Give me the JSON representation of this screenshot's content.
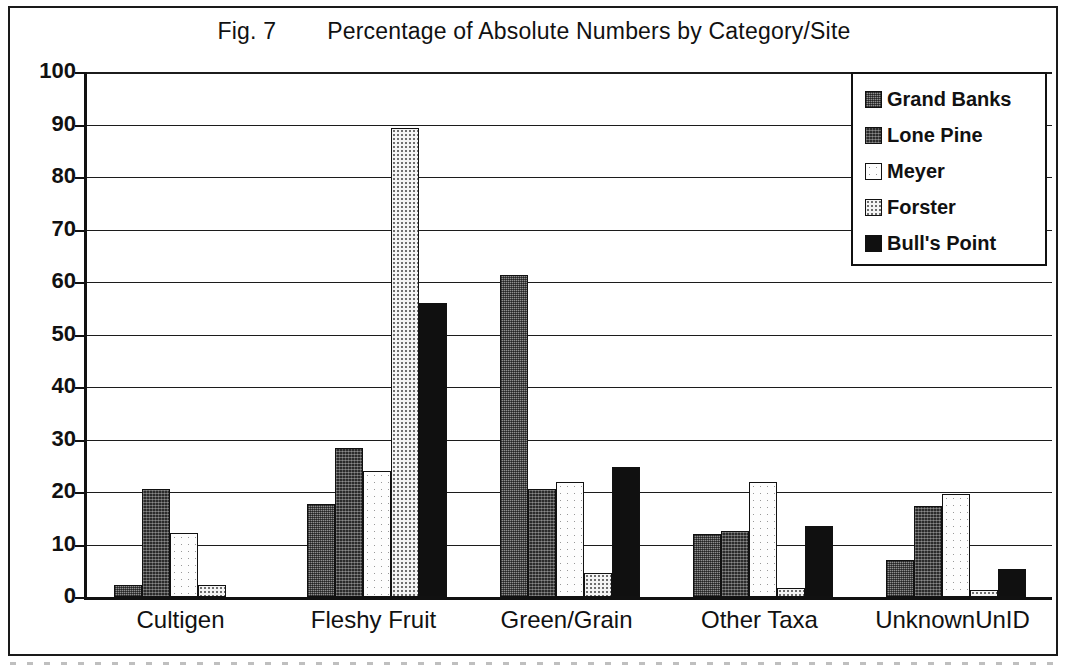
{
  "figure": {
    "label": "Fig. 7",
    "title": "Percentage of Absolute Numbers by Category/Site"
  },
  "chart_data": {
    "type": "bar",
    "title": "Fig. 7    Percentage of Absolute Numbers by Category/Site",
    "xlabel": "",
    "ylabel": "",
    "ylim": [
      0,
      100
    ],
    "yticks": [
      0,
      10,
      20,
      30,
      40,
      50,
      60,
      70,
      80,
      90,
      100
    ],
    "ytick_labels": [
      "0",
      "10",
      "20",
      "30",
      "40",
      "50",
      "60",
      "70",
      "80",
      "90",
      "100"
    ],
    "grid": true,
    "legend_position": "top-right",
    "categories": [
      "Cultigen",
      "Fleshy Fruit",
      "Green/Grain",
      "Other Taxa",
      "UnknownUnID"
    ],
    "series": [
      {
        "name": "Grand Banks",
        "swatch": "medium-gray-dither",
        "color": "#8f8f8f",
        "values": [
          2.2,
          17.8,
          61.3,
          12.0,
          7.0
        ]
      },
      {
        "name": "Lone Pine",
        "swatch": "dark-dither",
        "color": "#2b2b2b",
        "values": [
          20.6,
          28.3,
          20.5,
          12.6,
          17.4
        ]
      },
      {
        "name": "Meyer",
        "swatch": "white-sparse-dots",
        "color": "#fdfdfd",
        "values": [
          12.2,
          24.0,
          22.0,
          22.0,
          19.7
        ]
      },
      {
        "name": "Forster",
        "swatch": "light-dotted",
        "color": "#f4f4f4",
        "values": [
          2.2,
          89.3,
          4.5,
          1.7,
          1.3
        ]
      },
      {
        "name": "Bull's Point",
        "swatch": "solid-black",
        "color": "#101010",
        "values": [
          0,
          56.0,
          24.7,
          13.5,
          5.3
        ]
      }
    ]
  }
}
